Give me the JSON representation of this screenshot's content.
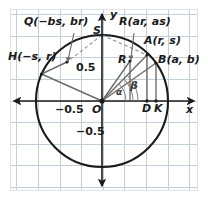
{
  "figure": {
    "type": "unit-circle-diagram",
    "background": "#ffffff",
    "grid_color": "#c3cedb",
    "frame_color": "#dde4ec",
    "axis_color": "#1b1b1b",
    "circle_color": "#1b1b1b",
    "segment_color": "#6b6b6b",
    "dashed_color": "#9a9a9a",
    "label_color": "#1b1b1b"
  },
  "axes": {
    "x_label": "x",
    "y_label": "y",
    "origin_label": "O",
    "ticks": {
      "x_negative": "−0.5",
      "y_positive": "0.5",
      "y_negative": "−0.5"
    }
  },
  "points": [
    {
      "id": "Q",
      "label": "Q(−bs, br)"
    },
    {
      "id": "S",
      "label": "S"
    },
    {
      "id": "R_top",
      "label": "R(ar, as)"
    },
    {
      "id": "A",
      "label": "A(r, s)"
    },
    {
      "id": "H",
      "label": "H(−s, r)"
    },
    {
      "id": "R",
      "label": "R"
    },
    {
      "id": "B",
      "label": "B(a, b)"
    },
    {
      "id": "D",
      "label": "D"
    },
    {
      "id": "K",
      "label": "K"
    },
    {
      "id": "O",
      "label": "O"
    }
  ],
  "angles": [
    {
      "id": "alpha",
      "label": "α"
    },
    {
      "id": "beta",
      "label": "β"
    }
  ]
}
